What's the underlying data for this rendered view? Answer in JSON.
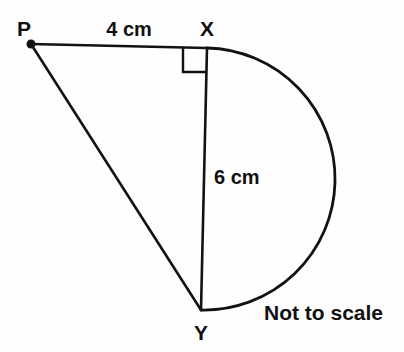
{
  "figure": {
    "note": "Not to scale",
    "background_color": "#fefefe",
    "stroke_color": "#121212",
    "vertices": [
      {
        "id": "P",
        "label": "P",
        "x": 31,
        "y": 44,
        "label_x": 24,
        "label_y": 36,
        "has_dot": true
      },
      {
        "id": "X",
        "label": "X",
        "x": 207,
        "y": 48,
        "label_x": 207,
        "label_y": 36,
        "has_dot": false
      },
      {
        "id": "Y",
        "label": "Y",
        "x": 201,
        "y": 310,
        "label_x": 201,
        "label_y": 340,
        "has_dot": false
      }
    ],
    "segments": [
      {
        "id": "PX",
        "from": "P",
        "to": "X",
        "length_label": "4 cm",
        "label_x": 129,
        "label_y": 36
      },
      {
        "id": "XY",
        "from": "X",
        "to": "Y",
        "length_label": "6 cm",
        "label_x": 214,
        "label_y": 184
      },
      {
        "id": "PY",
        "from": "P",
        "to": "Y",
        "length_label": "",
        "label_x": 0,
        "label_y": 0
      }
    ],
    "arc": {
      "id": "semicircle-XY",
      "description": "semicircle on diameter XY bulging to the right",
      "start_x": 207,
      "start_y": 48,
      "end_x": 201,
      "end_y": 310,
      "radius": 131,
      "rightmost_x": 334,
      "sweep": 1
    },
    "right_angle": {
      "at_vertex": "X",
      "size": 24,
      "corner_x": 207,
      "corner_y": 48,
      "path": "M 183 48 L 183 72 L 207 72"
    }
  },
  "note_text": {
    "value": "Not to scale",
    "x": 264,
    "y": 320
  }
}
